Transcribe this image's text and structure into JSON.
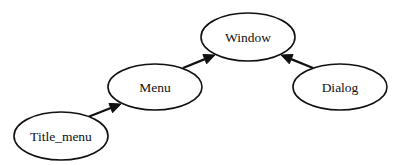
{
  "diagram": {
    "type": "directed-graph",
    "nodes": [
      {
        "id": "window",
        "label": "Window",
        "cx": 248,
        "cy": 37,
        "rx": 47,
        "ry": 24
      },
      {
        "id": "menu",
        "label": "Menu",
        "cx": 155,
        "cy": 87,
        "rx": 47,
        "ry": 23
      },
      {
        "id": "dialog",
        "label": "Dialog",
        "cx": 340,
        "cy": 87,
        "rx": 47,
        "ry": 23
      },
      {
        "id": "title_menu",
        "label": "Title_menu",
        "cx": 61,
        "cy": 136,
        "rx": 47,
        "ry": 24
      }
    ],
    "edges": [
      {
        "from": "Title_menu",
        "to": "Menu",
        "x1": 88,
        "y1": 117,
        "x2": 121,
        "y2": 104
      },
      {
        "from": "Menu",
        "to": "Window",
        "x1": 183,
        "y1": 68,
        "x2": 215,
        "y2": 55
      },
      {
        "from": "Dialog",
        "to": "Window",
        "x1": 313,
        "y1": 68,
        "x2": 281,
        "y2": 55
      }
    ],
    "colors": {
      "stroke": "#111111",
      "fill": "#ffffff",
      "text": "#111111"
    }
  }
}
